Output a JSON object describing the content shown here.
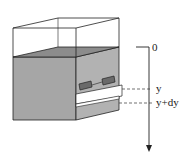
{
  "diagram": {
    "type": "tank-with-strip",
    "axis": {
      "origin_label": "0",
      "y_label": "y",
      "y_dy_label": "y+dy",
      "direction": "down"
    },
    "colors": {
      "water": "#a0a0a0",
      "water_top": "#8a8a8a",
      "water_side": "#b4b4b4",
      "gate": "#6a6a6a",
      "outline": "#222222",
      "strip": "#ffffff"
    }
  }
}
